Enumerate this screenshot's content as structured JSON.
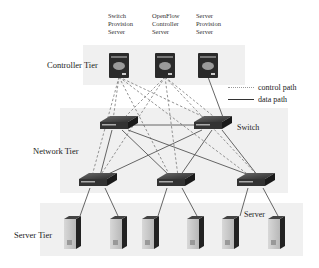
{
  "controller_labels": [
    {
      "lines": [
        "Switch",
        "Provision",
        "Server"
      ]
    },
    {
      "lines": [
        "OpenFlow",
        "Controller",
        "Server"
      ]
    },
    {
      "lines": [
        "Server",
        "Provision",
        "Server"
      ]
    }
  ],
  "tiers": {
    "controller": "Controller Tier",
    "network": "Network Tier",
    "server": "Server Tier"
  },
  "legend": {
    "control_path": "control path",
    "data_path": "data path"
  },
  "annotations": {
    "switch": "Switch",
    "server": "Server"
  },
  "colors": {
    "panel_bg": "#f0f0f0",
    "device_dark": "#2a2a2a",
    "control_line": "#777777",
    "data_line": "#555555"
  }
}
